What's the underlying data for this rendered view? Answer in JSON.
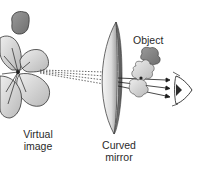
{
  "diagram": {
    "labels": {
      "object": "Object",
      "virtual_image_line1": "Virtual",
      "virtual_image_line2": "image",
      "mirror_line1": "Curved",
      "mirror_line2": "mirror"
    },
    "elements": [
      {
        "name": "virtual-image-flower",
        "description": "large grey flower (enlarged virtual image) on left"
      },
      {
        "name": "dashed-sight-lines",
        "description": "dotted lines from virtual image to mirror"
      },
      {
        "name": "curved-mirror",
        "description": "concave lens-shaped mirror in center"
      },
      {
        "name": "object-flower",
        "description": "small flower object in front of mirror"
      },
      {
        "name": "reflected-rays",
        "description": "arrowed rays from mirror toward eye"
      },
      {
        "name": "eye",
        "description": "observer eye on right"
      }
    ],
    "colors": {
      "flower_light": "#d6d6d6",
      "flower_dark": "#8a8a8a",
      "mirror_face": "#e8e8e8",
      "mirror_edge": "#5a5a5a",
      "line": "#222222"
    }
  }
}
